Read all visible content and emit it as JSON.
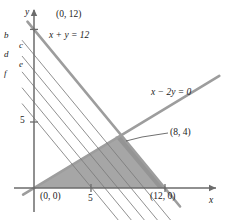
{
  "figure": {
    "axes": {
      "x_label": "x",
      "y_label": "y",
      "x_tick_label": "5",
      "y_tick_label": "5",
      "origin_px": [
        34,
        188
      ],
      "x_unit_px": 10.9,
      "y_unit_px": 13.2,
      "x_range": [
        -1,
        17
      ],
      "y_range": [
        -1,
        14
      ]
    },
    "points": [
      {
        "id": "p-0-12",
        "label": "(0, 12)",
        "x": 0,
        "y": 12
      },
      {
        "id": "p-0-0",
        "label": "(0, 0)",
        "x": 0,
        "y": 0
      },
      {
        "id": "p-12-0",
        "label": "(12, 0)",
        "x": 12,
        "y": 0
      },
      {
        "id": "p-8-4",
        "label": "(8, 4)",
        "x": 8,
        "y": 4
      }
    ],
    "constraint_lines": [
      {
        "id": "line-x-plus-y",
        "label": "x + y = 12",
        "slope": -1,
        "intercept": 12,
        "color": "#9a9a9a"
      },
      {
        "id": "line-x-minus-2y",
        "label": "x − 2y = 0",
        "slope": 0.5,
        "intercept": 0,
        "color": "#9a9a9a"
      }
    ],
    "objective_lines": [
      {
        "id": "obj-b",
        "label": "b",
        "slope": -1,
        "intercept": 10.1
      },
      {
        "id": "obj-c",
        "label": "c",
        "slope": -1,
        "intercept": 8.9
      },
      {
        "id": "obj-d",
        "label": "d",
        "slope": -1,
        "intercept": 7.7
      },
      {
        "id": "obj-e",
        "label": "e",
        "slope": -1,
        "intercept": 6.5
      },
      {
        "id": "obj-f",
        "label": "f",
        "slope": -1,
        "intercept": 5.3
      }
    ],
    "feasible_region": {
      "id": "shaded-triangle",
      "vertices": [
        [
          0,
          0
        ],
        [
          8,
          4
        ],
        [
          12,
          0
        ]
      ],
      "fill": "#a6a6a6"
    },
    "colors": {
      "axis": "#6b6b6b",
      "constraint_line": "#9d9d9d",
      "objective_line": "#7c7c7c",
      "shade": "#a6a6a6",
      "shade_dark": "#8e8e8e",
      "text": "#1b1b1b",
      "background": "#ffffff"
    },
    "leader_line": {
      "id": "leader-8-4",
      "from_px": [
        168,
        133
      ],
      "to_px": [
        128,
        140
      ]
    }
  }
}
